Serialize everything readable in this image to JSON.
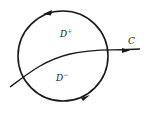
{
  "diagram": {
    "type": "region-split-by-curve",
    "circle": {
      "cx": 63,
      "cy": 56,
      "r": 45,
      "orientation": "counterclockwise"
    },
    "curve_label": "C",
    "regions": [
      {
        "name": "D",
        "sign": "+",
        "position": "upper"
      },
      {
        "name": "D",
        "sign": "−",
        "position": "lower"
      }
    ],
    "colors": {
      "stroke": "#1a1a1a",
      "background": "#ffffff"
    }
  }
}
